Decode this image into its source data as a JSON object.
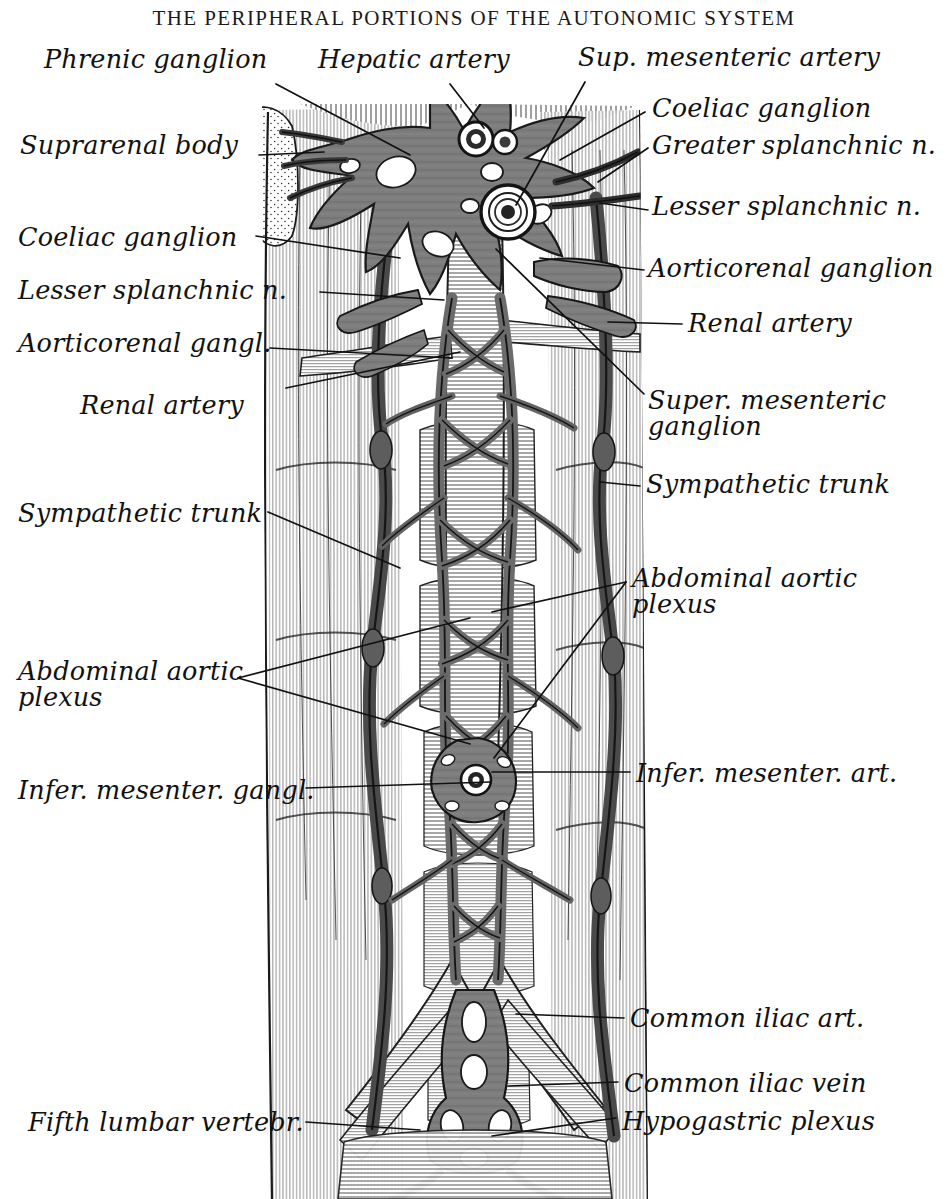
{
  "plate": {
    "title": "THE PERIPHERAL PORTIONS OF THE AUTONOMIC SYSTEM",
    "subject": "Abdominal autonomic nervous system: coeliac plexus, aortic plexus and hypogastric plexus",
    "style": "monochrome anatomical engraving",
    "ink_color": "#111111",
    "paper_color": "#ffffff",
    "plexus_gray": "#7d7d7d",
    "plexus_gray_dark": "#5a5a5a",
    "outline_color": "#1a1a1a"
  },
  "labels": {
    "left": [
      {
        "id": "phrenic-ganglion",
        "text": "Phrenic ganglion",
        "x": 44,
        "y": 46
      },
      {
        "id": "suprarenal-body",
        "text": "Suprarenal body",
        "x": 20,
        "y": 132
      },
      {
        "id": "coeliac-ganglion-left",
        "text": "Coeliac ganglion",
        "x": 18,
        "y": 224
      },
      {
        "id": "lesser-splanchnic-left",
        "text": "Lesser splanchnic n.",
        "x": 18,
        "y": 277
      },
      {
        "id": "aorticorenal-gangl-left",
        "text": "Aorticorenal gangl.",
        "x": 18,
        "y": 330
      },
      {
        "id": "renal-artery-left",
        "text": "Renal artery",
        "x": 80,
        "y": 392
      },
      {
        "id": "sympathetic-trunk-left",
        "text": "Sympathetic trunk",
        "x": 18,
        "y": 500
      },
      {
        "id": "abdominal-aortic-plexus-left",
        "text": "Abdominal aortic\nplexus",
        "x": 18,
        "y": 658
      },
      {
        "id": "infer-mesenter-gangl",
        "text": "Infer. mesenter. gangl.",
        "x": 18,
        "y": 777
      },
      {
        "id": "fifth-lumbar-vertebr",
        "text": "Fifth lumbar vertebr.",
        "x": 28,
        "y": 1109
      }
    ],
    "right": [
      {
        "id": "hepatic-artery",
        "text": "Hepatic artery",
        "x": 318,
        "y": 46
      },
      {
        "id": "sup-mesenteric-artery",
        "text": "Sup. mesenteric artery",
        "x": 578,
        "y": 44
      },
      {
        "id": "coeliac-ganglion-right",
        "text": "Coeliac ganglion",
        "x": 652,
        "y": 95
      },
      {
        "id": "greater-splanchnic-n",
        "text": "Greater splanchnic n.",
        "x": 652,
        "y": 132
      },
      {
        "id": "lesser-splanchnic-right",
        "text": "Lesser splanchnic n.",
        "x": 652,
        "y": 193
      },
      {
        "id": "aorticorenal-ganglion-right",
        "text": "Aorticorenal ganglion",
        "x": 648,
        "y": 255
      },
      {
        "id": "renal-artery-right",
        "text": "Renal artery",
        "x": 688,
        "y": 310
      },
      {
        "id": "super-mesenteric-ganglion",
        "text": "Super. mesenteric\nganglion",
        "x": 648,
        "y": 387
      },
      {
        "id": "sympathetic-trunk-right",
        "text": "Sympathetic trunk",
        "x": 646,
        "y": 471
      },
      {
        "id": "abdominal-aortic-plexus-right",
        "text": "Abdominal aortic\nplexus",
        "x": 632,
        "y": 565
      },
      {
        "id": "infer-mesenter-art",
        "text": "Infer. mesenter. art.",
        "x": 636,
        "y": 760
      },
      {
        "id": "common-iliac-art",
        "text": "Common iliac art.",
        "x": 630,
        "y": 1005
      },
      {
        "id": "common-iliac-vein",
        "text": "Common iliac vein",
        "x": 624,
        "y": 1070
      },
      {
        "id": "hypogastric-plexus",
        "text": "Hypogastric plexus",
        "x": 622,
        "y": 1108
      }
    ]
  },
  "leaders": [
    {
      "id": "leader-phrenic-ganglion",
      "points": "276,84 410,155"
    },
    {
      "id": "leader-suprarenal-body",
      "points": "259,155 324,152"
    },
    {
      "id": "leader-coeliac-ganglion-left",
      "points": "256,236 400,258"
    },
    {
      "id": "leader-lesser-splanchnic-left",
      "points": "320,292 444,300"
    },
    {
      "id": "leader-aorticorenal-gangl-left",
      "points": "270,348 452,358"
    },
    {
      "id": "leader-renal-artery-left",
      "points": "286,388 460,352"
    },
    {
      "id": "leader-hepatic-artery",
      "points": "450,84 484,128"
    },
    {
      "id": "leader-sup-mesenteric-artery",
      "points": "585,82 516,205"
    },
    {
      "id": "leader-coeliac-ganglion-right",
      "points": "645,112 560,160"
    },
    {
      "id": "leader-greater-splanchnic-n",
      "points": "648,148 598,182"
    },
    {
      "id": "leader-lesser-splanchnic-right",
      "points": "648,210 600,203"
    },
    {
      "id": "leader-aorticorenal-ganglion-right",
      "points": "644,270 540,258"
    },
    {
      "id": "leader-renal-artery-right",
      "points": "682,324 608,322"
    },
    {
      "id": "leader-super-mesenteric-ganglion",
      "points": "644,394 496,249"
    },
    {
      "id": "leader-sympathetic-trunk-right",
      "points": "640,486 600,482"
    },
    {
      "id": "leader-sympathetic-trunk-left",
      "points": "268,512 400,568"
    },
    {
      "id": "leader-abdominal-aortic-1",
      "points": "626,582 492,612"
    },
    {
      "id": "leader-abdominal-aortic-2",
      "points": "626,582 494,758"
    },
    {
      "id": "leader-abdominal-aortic-left-1",
      "points": "238,678 470,618"
    },
    {
      "id": "leader-abdominal-aortic-left-2",
      "points": "238,678 470,744"
    },
    {
      "id": "leader-infer-mesenter-art",
      "points": "630,772 492,772"
    },
    {
      "id": "leader-infer-mesenter-gangl",
      "points": "306,788 490,782"
    },
    {
      "id": "leader-common-iliac-art",
      "points": "624,1018 516,1014"
    },
    {
      "id": "leader-common-iliac-vein",
      "points": "618,1082 508,1086"
    },
    {
      "id": "leader-hypogastric-plexus",
      "points": "616,1118 492,1136"
    },
    {
      "id": "leader-fifth-lumbar-vertebr",
      "points": "306,1122 420,1130"
    }
  ]
}
